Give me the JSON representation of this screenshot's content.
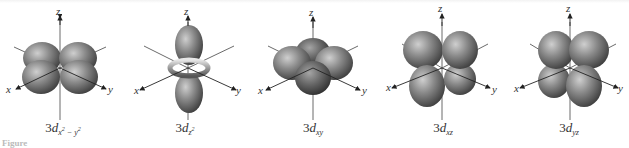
{
  "diagram": {
    "axis_labels": {
      "x": "x",
      "y": "y",
      "z": "z"
    },
    "lobe_color": "#808080",
    "lobe_highlight": "#c8c8c8",
    "lobe_shadow": "#3a3a3a",
    "orbitals": [
      {
        "id": "dx2-y2",
        "prefix": "3",
        "d": "d",
        "sub": "x² − y²",
        "sub_main": "x",
        "sub_sup": "2",
        "sub_mid": " − y",
        "sub_sup2": "2"
      },
      {
        "id": "dz2",
        "prefix": "3",
        "d": "d",
        "sub_main": "z",
        "sub_sup": "2"
      },
      {
        "id": "dxy",
        "prefix": "3",
        "d": "d",
        "sub_main": "xy"
      },
      {
        "id": "dxz",
        "prefix": "3",
        "d": "d",
        "sub_main": "xz"
      },
      {
        "id": "dyz",
        "prefix": "3",
        "d": "d",
        "sub_main": "yz"
      }
    ],
    "caption_fragment": "Figure"
  }
}
